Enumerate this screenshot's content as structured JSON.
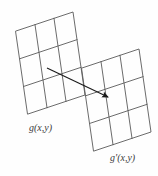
{
  "figure": {
    "background_color": "#fefefe",
    "line_color": "#555555",
    "arrow_color": "#1a1a1a",
    "width": 158,
    "height": 176
  },
  "labels": {
    "source": "g(x,y)",
    "target": "g'(x,y)"
  },
  "grids": [
    {
      "id": "source-grid",
      "name": "source-grid",
      "label": "g(x,y)",
      "rows": 3,
      "cols": 3,
      "corners": {
        "top_left": [
          16,
          31
        ],
        "top_right": [
          73,
          12
        ],
        "bottom_right": [
          85,
          95
        ],
        "bottom_left": [
          28,
          114
        ]
      }
    },
    {
      "id": "target-grid",
      "name": "target-grid",
      "label": "g'(x,y)",
      "rows": 3,
      "cols": 3,
      "corners": {
        "top_left": [
          82,
          68
        ],
        "top_right": [
          139,
          49
        ],
        "bottom_right": [
          151,
          132
        ],
        "bottom_left": [
          94,
          151
        ]
      }
    }
  ],
  "arrow": {
    "name": "mapping-arrow",
    "start": [
      47,
      68
    ],
    "end": [
      112,
      99
    ],
    "head_size": 6
  }
}
